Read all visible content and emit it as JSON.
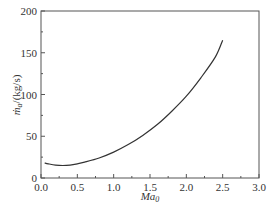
{
  "chart_data": {
    "type": "line",
    "title": "",
    "xlabel": "Ma0",
    "ylabel": "ṁa/(kg/s)",
    "xlim": [
      0.0,
      3.0
    ],
    "ylim": [
      0,
      200
    ],
    "xticks": [
      "0.0",
      "0.5",
      "1.0",
      "1.5",
      "2.0",
      "2.5",
      "3.0"
    ],
    "yticks": [
      "0",
      "50",
      "100",
      "150",
      "200"
    ],
    "grid": false,
    "legend": null,
    "series": [
      {
        "name": "ṁa",
        "x": [
          0.05,
          0.1,
          0.2,
          0.3,
          0.4,
          0.5,
          0.6,
          0.8,
          1.0,
          1.2,
          1.4,
          1.6,
          1.8,
          2.0,
          2.2,
          2.4,
          2.5
        ],
        "y": [
          18,
          17,
          15.5,
          15,
          15.5,
          17,
          19,
          24,
          31,
          40,
          51,
          64,
          80,
          98,
          120,
          145,
          165
        ]
      }
    ]
  },
  "labels": {
    "x_axis_main": "Ma",
    "x_axis_sub": "0",
    "y_axis_main": "ṁ",
    "y_axis_sub": "a",
    "y_axis_unit": "/(kg/s)"
  }
}
